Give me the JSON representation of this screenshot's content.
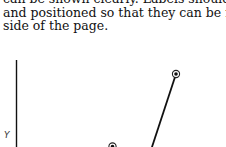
{
  "document": {
    "paragraph_lines": [
      "can be shown clearly. Labels should be",
      "and positioned so that they can be read",
      "side of the page."
    ]
  },
  "figure": {
    "y_axis_label": "Y",
    "line_color": "#111111",
    "marker_style": "circled-dot",
    "visible_points": [
      {
        "x": 176,
        "y": 74
      },
      {
        "x": 112,
        "y": 146
      }
    ],
    "visible_segment": {
      "from": [
        176,
        74
      ],
      "to": [
        152,
        147
      ]
    }
  }
}
